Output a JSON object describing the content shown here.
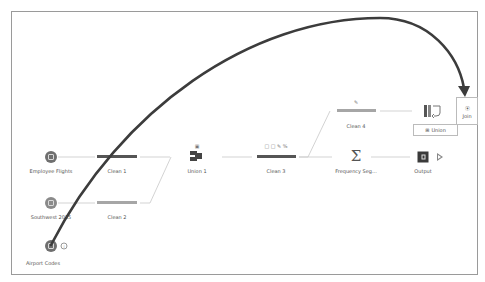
{
  "canvas": {
    "nodes": {
      "employee_flights": {
        "label": "Employee Flights",
        "type": "input"
      },
      "southwest_2015": {
        "label": "Southwest 2015",
        "type": "input"
      },
      "airport_codes": {
        "label": "Airport Codes",
        "type": "input",
        "badge": "i"
      },
      "clean1": {
        "label": "Clean 1",
        "type": "clean"
      },
      "clean2": {
        "label": "Clean 2",
        "type": "clean"
      },
      "union1": {
        "label": "Union 1",
        "type": "union",
        "badge_icon": "note-icon"
      },
      "clean3": {
        "label": "Clean 3",
        "type": "clean",
        "change_icons": "□ □ ✎ %"
      },
      "clean4": {
        "label": "Clean 4",
        "type": "clean",
        "change_icons": "✎"
      },
      "frequency": {
        "label": "Frequency Seg...",
        "type": "aggregate",
        "symbol": "Σ"
      },
      "output": {
        "label": "Output",
        "type": "output"
      }
    },
    "drop_targets": {
      "join": {
        "label": "Join",
        "icon": "⦿"
      },
      "union": {
        "label": "Union",
        "icon": "⊞"
      }
    },
    "colors": {
      "node_dark": "#6f6f6f",
      "bar_dark": "#555555",
      "bar_light": "#a6a6a6",
      "connector": "#c8c8c8",
      "drag_path": "#3c3c3c",
      "border": "#9a9a9a"
    }
  }
}
